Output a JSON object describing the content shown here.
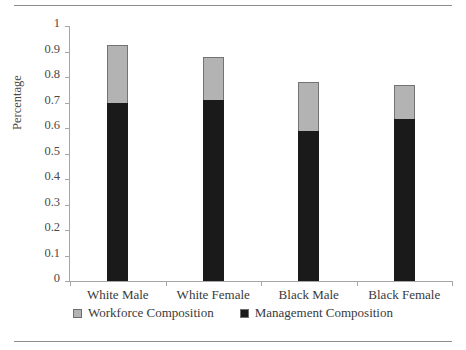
{
  "figure": {
    "background_color": "#ffffff",
    "rules": {
      "top_label": "top-rule",
      "bottom_label": "bottom-rule"
    }
  },
  "chart_data": {
    "type": "bar",
    "subtype": "stacked-column",
    "title": "",
    "xlabel": "",
    "ylabel": "Percentage",
    "ylim": [
      0,
      1
    ],
    "ytick_labels": [
      "1",
      "0.9",
      "0.8",
      "0.7",
      "0.6",
      "0.5",
      "0.4",
      "0.3",
      "0.2",
      "0.1",
      "0"
    ],
    "ytick_values": [
      1,
      0.9,
      0.8,
      0.7,
      0.6,
      0.5,
      0.4,
      0.3,
      0.2,
      0.1,
      0
    ],
    "grid": false,
    "legend_position": "bottom",
    "categories": [
      "White Male",
      "White Female",
      "Black Male",
      "Black Female"
    ],
    "series": [
      {
        "name": "Management Composition",
        "color": "#1a1a1a",
        "stack_order": 0,
        "values": [
          0.7,
          0.71,
          0.59,
          0.635
        ]
      },
      {
        "name": "Workforce Composition",
        "color": "#b3b3b3",
        "stack_order": 1,
        "values": [
          0.225,
          0.17,
          0.19,
          0.135
        ]
      }
    ],
    "stacked_totals": [
      0.925,
      0.88,
      0.78,
      0.77
    ]
  },
  "legend": {
    "items": [
      {
        "label": "Workforce Composition",
        "color": "#b3b3b3",
        "swatch_name": "workforce-swatch"
      },
      {
        "label": "Management Composition",
        "color": "#1a1a1a",
        "swatch_name": "management-swatch"
      }
    ]
  }
}
